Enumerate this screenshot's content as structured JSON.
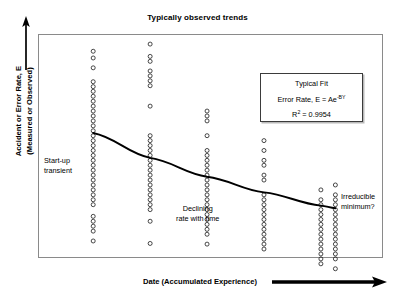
{
  "chart_data": {
    "type": "scatter",
    "title": "Typically observed trends",
    "xlabel": "Date (Accumulated Experience)",
    "ylabel_line1": "Accident or Error Rate, E",
    "ylabel_line2": "(Measured or Observed)",
    "grid": false,
    "axis_ticks": false,
    "xlim": [
      0,
      10
    ],
    "ylim": [
      0,
      10
    ],
    "legend_position": "none",
    "series": [
      {
        "name": "Observed error rate samples",
        "marker": "open-circle",
        "columns": [
          {
            "x": 1.6,
            "label": "column-1",
            "values": [
              9.23,
              8.93,
              8.49,
              7.87,
              7.65,
              7.44,
              7.22,
              7.0,
              6.78,
              6.56,
              6.34,
              6.12,
              5.9,
              5.68,
              5.46,
              5.24,
              5.02,
              4.8,
              4.58,
              4.36,
              4.14,
              3.92,
              3.7,
              3.48,
              3.26,
              3.04,
              2.82,
              2.6,
              2.38,
              1.86,
              1.64,
              1.42,
              1.2,
              0.76
            ]
          },
          {
            "x": 3.25,
            "label": "column-2",
            "values": [
              9.55,
              9.0,
              8.78,
              8.35,
              8.13,
              7.91,
              7.69,
              6.78,
              5.46,
              5.24,
              5.02,
              4.8,
              4.58,
              4.36,
              4.14,
              3.92,
              3.7,
              3.48,
              3.26,
              3.04,
              2.82,
              2.6,
              2.38,
              2.16,
              1.64,
              0.65
            ]
          },
          {
            "x": 4.9,
            "label": "column-3",
            "values": [
              6.56,
              6.34,
              6.12,
              5.46,
              4.8,
              4.58,
              4.36,
              4.14,
              3.92,
              3.7,
              3.48,
              3.26,
              3.04,
              2.82,
              2.6,
              2.38,
              2.16,
              1.94,
              1.72,
              1.5,
              1.28,
              1.06,
              0.62
            ]
          },
          {
            "x": 6.55,
            "label": "column-4",
            "values": [
              5.24,
              4.8,
              4.36,
              4.14,
              3.7,
              3.48,
              2.82,
              2.6,
              2.38,
              2.16,
              1.94,
              1.72,
              1.5,
              1.28,
              1.06,
              0.84,
              0.62,
              0.4
            ]
          },
          {
            "x": 8.2,
            "label": "column-5",
            "values": [
              3.04,
              2.6,
              2.38,
              2.16,
              1.94,
              1.72,
              1.5,
              1.28,
              1.06,
              0.84,
              0.62,
              0.4,
              0.18,
              -0.04,
              -0.26
            ]
          },
          {
            "x": 8.62,
            "label": "column-6",
            "values": [
              3.26,
              2.82,
              2.6,
              2.38,
              2.16,
              1.94,
              1.72,
              1.5,
              1.28,
              1.06,
              0.84,
              0.62,
              0.4,
              0.18,
              -0.04,
              -0.48
            ]
          }
        ]
      }
    ],
    "fit_curve": {
      "name": "Typical Fit",
      "equation_text": "Error Rate, E = Ae",
      "equation_exponent": "-BY",
      "r_squared_label": "R",
      "r_squared_exponent": "2",
      "r_squared_value": "= 0.9954",
      "points": [
        [
          1.6,
          5.58
        ],
        [
          3.25,
          4.47
        ],
        [
          4.9,
          3.63
        ],
        [
          6.55,
          2.93
        ],
        [
          8.2,
          2.34
        ],
        [
          8.62,
          2.22
        ]
      ]
    },
    "annotations": [
      {
        "id": "startup",
        "line1": "Start-up",
        "line2": "transient"
      },
      {
        "id": "declining",
        "line1": "Declining",
        "line2": "rate with time"
      },
      {
        "id": "irreducible",
        "line1": "Irreducible",
        "line2": "minimum?"
      }
    ]
  },
  "colors": {
    "frame": "#8a8a8a",
    "marker_stroke": "#1a1a1a",
    "trendline": "#000000",
    "text": "#000000",
    "fit_box_border": "#3b3b3b",
    "fit_box_shadow": "#b9b9b9",
    "background": "#ffffff"
  }
}
